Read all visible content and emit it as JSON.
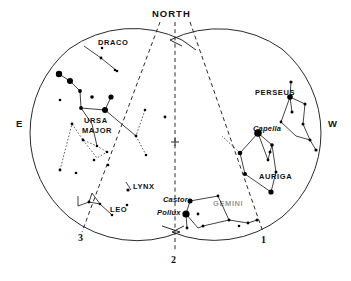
{
  "figure": {
    "type": "star-chart"
  },
  "cardinals": [
    {
      "name": "north",
      "label": "NORTH",
      "x": 152,
      "y": 8
    },
    {
      "name": "east",
      "label": "E",
      "x": 16,
      "y": 124
    },
    {
      "name": "west",
      "label": "W",
      "x": 328,
      "y": 124
    }
  ],
  "meridian_labels": [
    {
      "name": "meridian-1",
      "label": "1",
      "x": 261,
      "y": 240
    },
    {
      "name": "meridian-2",
      "label": "2",
      "x": 174,
      "y": 258
    },
    {
      "name": "meridian-3",
      "label": "3",
      "x": 80,
      "y": 237
    }
  ],
  "constellations": [
    {
      "name": "draco",
      "label": "DRACO",
      "x": 98,
      "y": 42
    },
    {
      "name": "ursa-major",
      "label": "URSA",
      "x": 84,
      "y": 120
    },
    {
      "name": "ursa-major2",
      "label": "MAJOR",
      "x": 82,
      "y": 130
    },
    {
      "name": "lynx",
      "label": "LYNX",
      "x": 133,
      "y": 184
    },
    {
      "name": "leo",
      "label": "LEO",
      "x": 110,
      "y": 209
    },
    {
      "name": "gemini",
      "label": "GEMINI",
      "x": 215,
      "y": 203
    },
    {
      "name": "auriga",
      "label": "AURIGA",
      "x": 261,
      "y": 176
    },
    {
      "name": "perseus",
      "label": "PERSEUS",
      "x": 257,
      "y": 92
    }
  ],
  "named_stars": [
    {
      "name": "capella",
      "label": "Capella",
      "x": 256,
      "y": 129
    },
    {
      "name": "castor",
      "label": "Castor",
      "x": 168,
      "y": 198
    },
    {
      "name": "pollux",
      "label": "Pollux",
      "x": 163,
      "y": 212
    }
  ],
  "chart_data": {
    "type": "scatter",
    "xlabel": "",
    "ylabel": "",
    "grid": false,
    "legend": "none",
    "horizon_circles": [
      {
        "name": "east-circle",
        "cx": 118,
        "cy": 133,
        "r": 110
      },
      {
        "name": "west-circle",
        "cx": 233,
        "cy": 133,
        "r": 110
      }
    ],
    "meridians": [
      {
        "id": "3",
        "x1": 132,
        "y1": 22,
        "x2": 82,
        "y2": 232,
        "style": "dashed"
      },
      {
        "id": "2",
        "x1": 175,
        "y1": 22,
        "x2": 175,
        "y2": 252,
        "style": "dashed"
      },
      {
        "id": "1",
        "x1": 195,
        "y1": 22,
        "x2": 263,
        "y2": 234,
        "style": "dashed"
      }
    ],
    "stars": [
      {
        "x": 59,
        "y": 74,
        "mag": 3.2
      },
      {
        "x": 70,
        "y": 81,
        "mag": 3.0
      },
      {
        "x": 80,
        "y": 91,
        "mag": 1.9
      },
      {
        "x": 81,
        "y": 108,
        "mag": 1.9
      },
      {
        "x": 105,
        "y": 110,
        "mag": 3.0
      },
      {
        "x": 92,
        "y": 97,
        "mag": 1.8
      },
      {
        "x": 111,
        "y": 97,
        "mag": 2.6
      },
      {
        "x": 101,
        "y": 58,
        "mag": 1.4
      },
      {
        "x": 117,
        "y": 71,
        "mag": 1.3
      },
      {
        "x": 72,
        "y": 124,
        "mag": 1.4
      },
      {
        "x": 83,
        "y": 140,
        "mag": 1.4
      },
      {
        "x": 97,
        "y": 146,
        "mag": 1.3
      },
      {
        "x": 107,
        "y": 152,
        "mag": 1.3
      },
      {
        "x": 60,
        "y": 170,
        "mag": 1.4
      },
      {
        "x": 76,
        "y": 173,
        "mag": 1.3
      },
      {
        "x": 136,
        "y": 136,
        "mag": 1.4
      },
      {
        "x": 146,
        "y": 155,
        "mag": 1.3
      },
      {
        "x": 145,
        "y": 110,
        "mag": 1.3
      },
      {
        "x": 165,
        "y": 117,
        "mag": 1.4
      },
      {
        "x": 128,
        "y": 190,
        "mag": 1.6
      },
      {
        "x": 60,
        "y": 100,
        "mag": 1.3
      },
      {
        "x": 89,
        "y": 202,
        "mag": 1.4
      },
      {
        "x": 100,
        "y": 204,
        "mag": 1.3
      },
      {
        "x": 112,
        "y": 215,
        "mag": 1.3
      },
      {
        "x": 127,
        "y": 205,
        "mag": 1.3
      },
      {
        "x": 218,
        "y": 196,
        "mag": 1.4
      },
      {
        "x": 190,
        "y": 201,
        "mag": 2.5
      },
      {
        "x": 186,
        "y": 214,
        "mag": 3.6
      },
      {
        "x": 198,
        "y": 214,
        "mag": 1.4
      },
      {
        "x": 187,
        "y": 228,
        "mag": 1.4
      },
      {
        "x": 203,
        "y": 226,
        "mag": 1.5
      },
      {
        "x": 229,
        "y": 220,
        "mag": 1.5
      },
      {
        "x": 248,
        "y": 223,
        "mag": 1.4
      },
      {
        "x": 257,
        "y": 220,
        "mag": 1.5
      },
      {
        "x": 239,
        "y": 226,
        "mag": 1.3
      },
      {
        "x": 258,
        "y": 133,
        "mag": 3.8
      },
      {
        "x": 240,
        "y": 153,
        "mag": 2.3
      },
      {
        "x": 245,
        "y": 174,
        "mag": 2.0
      },
      {
        "x": 271,
        "y": 192,
        "mag": 2.6
      },
      {
        "x": 272,
        "y": 145,
        "mag": 1.8
      },
      {
        "x": 270,
        "y": 152,
        "mag": 1.5
      },
      {
        "x": 268,
        "y": 160,
        "mag": 1.4
      },
      {
        "x": 276,
        "y": 172,
        "mag": 1.5
      },
      {
        "x": 290,
        "y": 97,
        "mag": 2.8
      },
      {
        "x": 291,
        "y": 82,
        "mag": 1.6
      },
      {
        "x": 292,
        "y": 112,
        "mag": 1.5
      },
      {
        "x": 305,
        "y": 104,
        "mag": 1.5
      },
      {
        "x": 303,
        "y": 124,
        "mag": 1.5
      },
      {
        "x": 310,
        "y": 140,
        "mag": 1.5
      },
      {
        "x": 316,
        "y": 150,
        "mag": 1.6
      },
      {
        "x": 281,
        "y": 122,
        "mag": 1.4
      },
      {
        "x": 102,
        "y": 48,
        "mag": 1.3
      },
      {
        "x": 115,
        "y": 70,
        "mag": 1.3
      },
      {
        "x": 94,
        "y": 160,
        "mag": 1.3
      },
      {
        "x": 108,
        "y": 165,
        "mag": 1.3
      }
    ]
  }
}
